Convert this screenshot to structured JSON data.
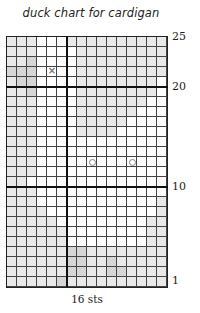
{
  "title": "duck chart for cardigan",
  "footer_label": "16 sts",
  "grid": {
    "columns": 16,
    "rows": 25,
    "legend": {
      "0": "background (white)",
      "1": "light gray",
      "2": "mid gray",
      "x": "cross stitch mark",
      "o": "circle mark (eye)"
    },
    "colors": {
      "0": "#ffffff",
      "1": "#e9e9e9",
      "2": "#d6d6d6"
    },
    "thick_vertical_after_column": 6,
    "thick_horizontal_above_rows": [
      20,
      10
    ],
    "row_labels": [
      {
        "row": 25,
        "label": "25"
      },
      {
        "row": 20,
        "label": "20"
      },
      {
        "row": 10,
        "label": "10"
      },
      {
        "row": 1,
        "label": "1"
      }
    ],
    "cells_top_to_bottom": [
      [
        "1",
        "1",
        "1",
        "0",
        "0",
        "0",
        "1",
        "1",
        "1",
        "1",
        "1",
        "1",
        "1",
        "1",
        "1",
        "1"
      ],
      [
        "1",
        "1",
        "1",
        "0",
        "0",
        "0",
        "0",
        "1",
        "1",
        "1",
        "1",
        "1",
        "1",
        "1",
        "1",
        "1"
      ],
      [
        "1",
        "1",
        "2",
        "0",
        "0",
        "0",
        "0",
        "1",
        "1",
        "1",
        "1",
        "1",
        "1",
        "1",
        "1",
        "1"
      ],
      [
        "2",
        "2",
        "2",
        "0",
        "x",
        "0",
        "0",
        "1",
        "1",
        "1",
        "1",
        "1",
        "1",
        "1",
        "1",
        "1"
      ],
      [
        "1",
        "2",
        "2",
        "0",
        "0",
        "0",
        "0",
        "1",
        "1",
        "1",
        "1",
        "1",
        "1",
        "1",
        "1",
        "0"
      ],
      [
        "1",
        "1",
        "2",
        "0",
        "0",
        "0",
        "0",
        "1",
        "1",
        "1",
        "1",
        "1",
        "1",
        "1",
        "1",
        "0"
      ],
      [
        "1",
        "1",
        "1",
        "0",
        "0",
        "0",
        "0",
        "1",
        "1",
        "1",
        "1",
        "1",
        "1",
        "1",
        "0",
        "0"
      ],
      [
        "1",
        "1",
        "1",
        "0",
        "0",
        "0",
        "0",
        "1",
        "1",
        "1",
        "1",
        "1",
        "1",
        "0",
        "0",
        "0"
      ],
      [
        "1",
        "1",
        "1",
        "0",
        "0",
        "0",
        "0",
        "1",
        "1",
        "1",
        "1",
        "1",
        "0",
        "0",
        "0",
        "0"
      ],
      [
        "1",
        "1",
        "1",
        "0",
        "0",
        "0",
        "0",
        "1",
        "1",
        "1",
        "1",
        "0",
        "0",
        "0",
        "0",
        "0"
      ],
      [
        "1",
        "1",
        "1",
        "0",
        "0",
        "0",
        "0",
        "0",
        "0",
        "0",
        "0",
        "0",
        "0",
        "0",
        "0",
        "0"
      ],
      [
        "1",
        "1",
        "1",
        "0",
        "0",
        "0",
        "0",
        "0",
        "0",
        "0",
        "0",
        "0",
        "0",
        "0",
        "0",
        "0"
      ],
      [
        "1",
        "1",
        "1",
        "0",
        "0",
        "0",
        "0",
        "0",
        "o",
        "0",
        "0",
        "0",
        "o",
        "0",
        "0",
        "0"
      ],
      [
        "1",
        "1",
        "1",
        "0",
        "0",
        "0",
        "0",
        "0",
        "0",
        "0",
        "0",
        "0",
        "0",
        "0",
        "0",
        "0"
      ],
      [
        "1",
        "1",
        "0",
        "0",
        "0",
        "0",
        "0",
        "0",
        "0",
        "0",
        "0",
        "0",
        "0",
        "0",
        "0",
        "0"
      ],
      [
        "1",
        "1",
        "1",
        "0",
        "0",
        "0",
        "0",
        "0",
        "0",
        "0",
        "0",
        "0",
        "0",
        "0",
        "0",
        "0"
      ],
      [
        "1",
        "1",
        "1",
        "0",
        "0",
        "0",
        "0",
        "0",
        "0",
        "0",
        "0",
        "0",
        "0",
        "0",
        "0",
        "1"
      ],
      [
        "1",
        "1",
        "1",
        "1",
        "0",
        "0",
        "0",
        "0",
        "0",
        "0",
        "0",
        "0",
        "0",
        "0",
        "0",
        "1"
      ],
      [
        "1",
        "1",
        "1",
        "1",
        "1",
        "0",
        "0",
        "0",
        "0",
        "0",
        "0",
        "0",
        "0",
        "0",
        "1",
        "1"
      ],
      [
        "1",
        "1",
        "1",
        "1",
        "1",
        "1",
        "0",
        "0",
        "0",
        "0",
        "0",
        "0",
        "0",
        "0",
        "1",
        "1"
      ],
      [
        "1",
        "1",
        "1",
        "1",
        "1",
        "1",
        "0",
        "0",
        "0",
        "0",
        "0",
        "0",
        "0",
        "0",
        "1",
        "1"
      ],
      [
        "1",
        "1",
        "1",
        "1",
        "1",
        "1",
        "2",
        "2",
        "1",
        "1",
        "1",
        "1",
        "1",
        "1",
        "1",
        "1"
      ],
      [
        "1",
        "1",
        "1",
        "1",
        "1",
        "1",
        "2",
        "2",
        "1",
        "1",
        "2",
        "1",
        "1",
        "1",
        "1",
        "1"
      ],
      [
        "1",
        "1",
        "1",
        "1",
        "1",
        "1",
        "2",
        "2",
        "1",
        "1",
        "2",
        "2",
        "1",
        "1",
        "1",
        "1"
      ],
      [
        "1",
        "1",
        "1",
        "1",
        "1",
        "2",
        "1",
        "1",
        "1",
        "1",
        "1",
        "1",
        "1",
        "1",
        "1",
        "1"
      ]
    ]
  }
}
